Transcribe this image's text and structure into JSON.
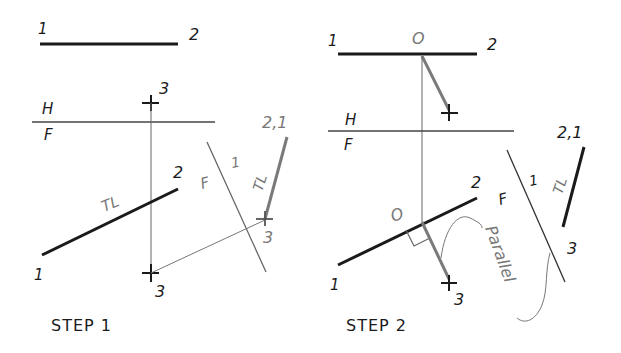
{
  "figure": {
    "colors": {
      "ink": "#1a1a1a",
      "gray_line": "#7a7a7a",
      "thin_line": "#555555",
      "background": "#ffffff"
    }
  },
  "step1": {
    "caption": "STEP 1",
    "top_view": {
      "label_1": "1",
      "label_2": "2"
    },
    "point_top": {
      "label": "3"
    },
    "fold_hf": {
      "upper": "H",
      "lower": "F"
    },
    "front_view": {
      "label_1": "1",
      "label_2": "2",
      "tl": "TL"
    },
    "point_front": {
      "label": "3"
    },
    "fold_f1": {
      "left": "F",
      "right": "1"
    },
    "aux_view": {
      "label_21": "2,1",
      "tl": "TL",
      "label_3": "3"
    }
  },
  "step2": {
    "caption": "STEP 2",
    "top_view": {
      "label_1": "1",
      "label_o": "O",
      "label_2": "2"
    },
    "fold_hf": {
      "upper": "H",
      "lower": "F"
    },
    "front_view": {
      "label_1": "1",
      "label_2": "2",
      "label_o": "O",
      "label_3": "3"
    },
    "fold_f1": {
      "left": "F",
      "right": "1"
    },
    "aux_view": {
      "label_21": "2,1",
      "tl": "TL",
      "label_3": "3"
    },
    "annotation": "Parallel"
  }
}
